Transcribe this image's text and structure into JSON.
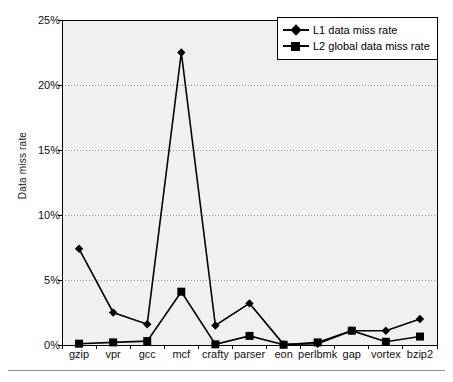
{
  "chart_data": {
    "type": "line",
    "title": "",
    "subtitle": "",
    "xlabel": "",
    "ylabel": "Data miss rate",
    "categories": [
      "gzip",
      "vpr",
      "gcc",
      "mcf",
      "crafty",
      "parser",
      "eon",
      "perlbmk",
      "gap",
      "vortex",
      "bzip2"
    ],
    "series": [
      {
        "name": "L1 data miss rate",
        "marker": "diamond",
        "color": "#000000",
        "values": [
          7.4,
          2.5,
          1.6,
          22.5,
          1.5,
          3.2,
          0.05,
          0.1,
          1.1,
          1.1,
          2.0
        ]
      },
      {
        "name": "L2 global data miss rate",
        "marker": "square",
        "color": "#000000",
        "values": [
          0.1,
          0.2,
          0.3,
          4.1,
          0.05,
          0.7,
          0.02,
          0.2,
          1.1,
          0.25,
          0.65
        ]
      }
    ],
    "ylim": [
      0,
      25
    ],
    "y_ticks": [
      0,
      5,
      10,
      15,
      20,
      25
    ],
    "y_tick_labels": [
      "0%",
      "5%",
      "10%",
      "15%",
      "20%",
      "25%"
    ],
    "grid": "horizontal-dotted",
    "legend_position": "top-right",
    "plot_background": "#f0f0f0",
    "page_background": "#ffffff",
    "axis_color": "#000000",
    "gridline_color": "#9a9a9a"
  }
}
